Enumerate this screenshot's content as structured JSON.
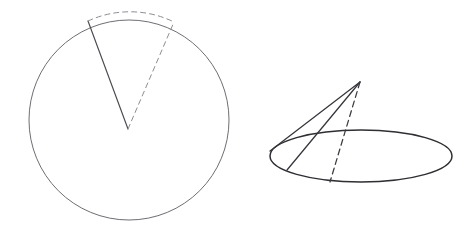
{
  "figure": {
    "canvas": {
      "width": 476,
      "height": 252,
      "background": "#ffffff"
    },
    "colors": {
      "outline_light": "#6e6e74",
      "outline_medium": "#4a4a50",
      "outline_dark": "#2e2e33",
      "dashed_light": "#8d8d93",
      "dashed_dark": "#3a3a40"
    },
    "shapes": {
      "circle": {
        "label": "circle",
        "center_x": 129,
        "center_y": 120,
        "radius": 100,
        "stroke": "#6e6e74",
        "stroke_width": 1,
        "fill": "none"
      },
      "sector": {
        "label": "sector",
        "apex_x": 128,
        "apex_y": 129,
        "left_arm_x": 88,
        "left_arm_y": 21,
        "right_arm_x": 174,
        "right_arm_y": 22,
        "left_arm_style": "solid",
        "right_arm_style": "dashed",
        "arc_style": "dashed",
        "arc_path": "M 88 21 A 100 100 0 0 1 174 22"
      },
      "cone": {
        "label": "cone",
        "apex_x": 360,
        "apex_y": 82,
        "base_center_x": 361,
        "base_center_y": 156,
        "base_rx": 91,
        "base_ry": 26,
        "slant_left_x": 270,
        "slant_left_y": 151,
        "slant_inner_x": 287,
        "slant_inner_y": 170,
        "slant_dashed_x": 330,
        "slant_dashed_y": 182,
        "base_stroke": "#2e2e33",
        "slant_stroke": "#35353b",
        "dashed_stroke": "#3a3a40"
      }
    }
  }
}
